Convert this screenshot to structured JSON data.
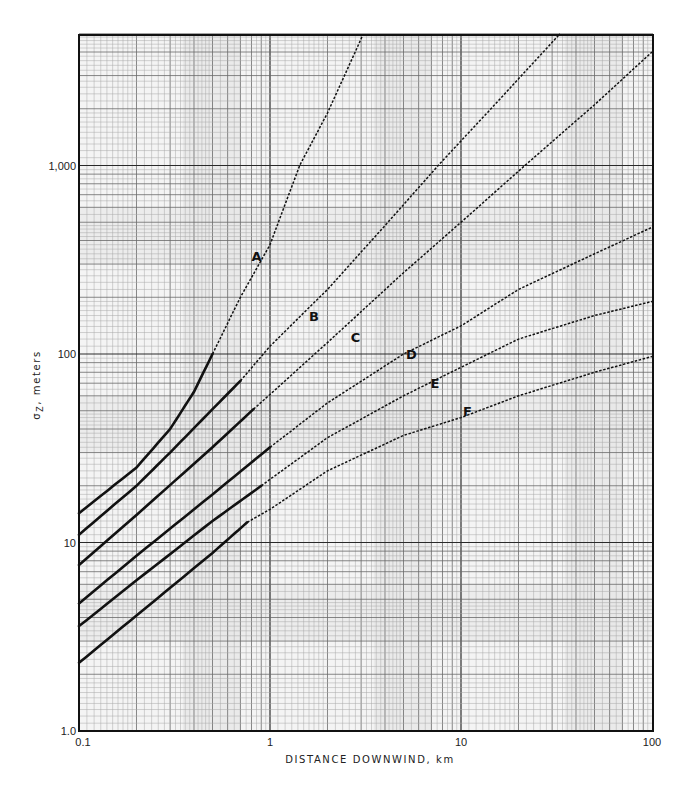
{
  "chart_data": {
    "type": "line",
    "title": "",
    "xlabel": "DISTANCE DOWNWIND, km",
    "ylabel": "σZ, meters",
    "ylabel_parts": {
      "sigma": "σ",
      "sub": "Z",
      "rest": ", meters"
    },
    "xscale": "log",
    "yscale": "log",
    "xlim": [
      0.1,
      100
    ],
    "ylim": [
      1.0,
      5000
    ],
    "grid": true,
    "x_ticks": [
      {
        "value": 0.1,
        "label": "0.1"
      },
      {
        "value": 1,
        "label": "1"
      },
      {
        "value": 10,
        "label": "10"
      },
      {
        "value": 100,
        "label": "100"
      }
    ],
    "y_ticks": [
      {
        "value": 1,
        "label": "1.0"
      },
      {
        "value": 10,
        "label": "10"
      },
      {
        "value": 100,
        "label": "100"
      },
      {
        "value": 1000,
        "label": "1,000"
      }
    ],
    "series": [
      {
        "name": "A",
        "solid_until_x": 0.5,
        "label_pos": {
          "x": 0.85,
          "y": 330
        },
        "points": [
          [
            0.1,
            14.3
          ],
          [
            0.2,
            25
          ],
          [
            0.3,
            40
          ],
          [
            0.4,
            63
          ],
          [
            0.5,
            100
          ],
          [
            0.7,
            200
          ],
          [
            1.0,
            380
          ],
          [
            1.43,
            1000
          ],
          [
            2.0,
            1900
          ],
          [
            3.07,
            4950
          ]
        ]
      },
      {
        "name": "B",
        "solid_until_x": 0.7,
        "label_pos": {
          "x": 1.7,
          "y": 160
        },
        "points": [
          [
            0.1,
            11.0
          ],
          [
            0.2,
            20
          ],
          [
            0.3,
            30
          ],
          [
            0.5,
            51
          ],
          [
            0.7,
            72
          ],
          [
            1.0,
            110
          ],
          [
            2.0,
            220
          ],
          [
            4.0,
            480
          ],
          [
            7.6,
            1000
          ],
          [
            15,
            2100
          ],
          [
            33,
            5000
          ]
        ]
      },
      {
        "name": "C",
        "solid_until_x": 0.82,
        "label_pos": {
          "x": 2.8,
          "y": 123
        },
        "points": [
          [
            0.1,
            7.6
          ],
          [
            0.2,
            14
          ],
          [
            0.5,
            32
          ],
          [
            0.82,
            51
          ],
          [
            1.0,
            61
          ],
          [
            2.0,
            115
          ],
          [
            5.0,
            270
          ],
          [
            10,
            500
          ],
          [
            21.6,
            1000
          ],
          [
            50,
            2100
          ],
          [
            100,
            4000
          ]
        ]
      },
      {
        "name": "D",
        "solid_until_x": 1.0,
        "label_pos": {
          "x": 5.5,
          "y": 100
        },
        "points": [
          [
            0.1,
            4.75
          ],
          [
            0.2,
            8.5
          ],
          [
            0.5,
            18
          ],
          [
            1.0,
            32
          ],
          [
            2.0,
            55
          ],
          [
            5.0,
            100
          ],
          [
            10,
            141
          ],
          [
            20,
            220
          ],
          [
            50,
            340
          ],
          [
            100,
            470
          ]
        ]
      },
      {
        "name": "E",
        "solid_until_x": 0.9,
        "label_pos": {
          "x": 7.3,
          "y": 70
        },
        "points": [
          [
            0.1,
            3.6
          ],
          [
            0.2,
            6.3
          ],
          [
            0.5,
            13
          ],
          [
            0.9,
            20
          ],
          [
            2.0,
            36
          ],
          [
            5.0,
            60
          ],
          [
            10,
            85
          ],
          [
            20,
            120
          ],
          [
            50,
            160
          ],
          [
            100,
            190
          ]
        ]
      },
      {
        "name": "F",
        "solid_until_x": 0.76,
        "label_pos": {
          "x": 10.8,
          "y": 50
        },
        "points": [
          [
            0.1,
            2.3
          ],
          [
            0.2,
            4.1
          ],
          [
            0.5,
            8.8
          ],
          [
            0.76,
            12.8
          ],
          [
            1.0,
            15
          ],
          [
            2.0,
            24
          ],
          [
            5.0,
            37
          ],
          [
            10,
            46
          ],
          [
            20,
            60
          ],
          [
            50,
            80
          ],
          [
            100,
            97
          ]
        ]
      }
    ]
  },
  "colors": {
    "grid_major": "#2a2a2a",
    "grid_minor": "#6a6a6a",
    "grid_fine": "#a8a8a8",
    "curve": "#111111",
    "band": "#e6e6e6"
  }
}
